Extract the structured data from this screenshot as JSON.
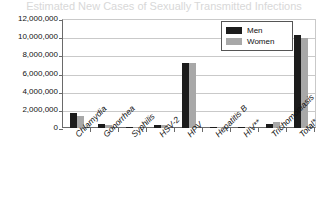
{
  "chart_data": {
    "type": "bar",
    "title": "Estimated New Cases of Sexually Transmitted Infections",
    "subtitle": "",
    "xlabel": "",
    "ylabel": "",
    "ylim": [
      0,
      12000000
    ],
    "ytick_values": [
      0,
      2000000,
      4000000,
      6000000,
      8000000,
      10000000,
      12000000
    ],
    "ytick_labels": [
      "0",
      "2,000,000",
      "4,000,000",
      "6,000,000",
      "8,000,000",
      "10,000,000",
      "12,000,000"
    ],
    "grid": true,
    "legend_position": "upper-right-inside",
    "categories": [
      "Chlamydia",
      "Gonorrhea",
      "Syphilis",
      "HSV-2",
      "HPV",
      "Hepatitis B",
      "HIV**",
      "Trichomoniasis",
      "Total*"
    ],
    "series": [
      {
        "name": "Men",
        "color": "#1c1c1c",
        "values": [
          1600000,
          430000,
          45000,
          320000,
          7150000,
          40000,
          35000,
          420000,
          10200000
        ]
      },
      {
        "name": "Women",
        "color": "#a8a8a8",
        "values": [
          1300000,
          320000,
          35000,
          320000,
          7150000,
          30000,
          25000,
          690000,
          9900000
        ]
      }
    ],
    "annotations": []
  },
  "legend": {
    "items": [
      {
        "label": "Men",
        "color": "#1c1c1c"
      },
      {
        "label": "Women",
        "color": "#a8a8a8"
      }
    ]
  }
}
